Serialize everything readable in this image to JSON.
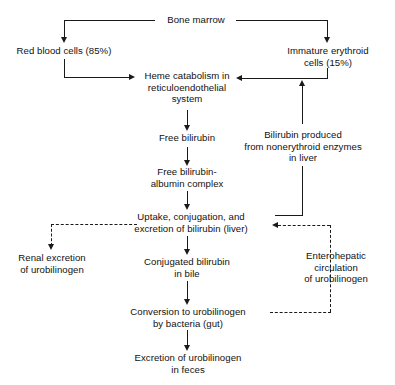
{
  "diagram": {
    "colors": {
      "background": "#ffffff",
      "ink": "#1a1a1a",
      "text": "#111111"
    },
    "nodes": {
      "bone_marrow": "Bone marrow",
      "red_blood_cells": "Red blood cells (85%)",
      "immature_erythroid": "Immature erythroid\ncells (15%)",
      "heme_catabolism": "Heme catabolism in\nreticuloendothelial\nsystem",
      "free_bilirubin": "Free bilirubin",
      "free_bilirubin_albumin": "Free bilirubin-\nalbumin complex",
      "bilirubin_nonerythroid": "Bilirubin produced\nfrom nonerythroid enzymes\nin liver",
      "uptake_conjugation": "Uptake, conjugation, and\nexcretion of bilirubin (liver)",
      "renal_excretion": "Renal excretion\nof urobilinogen",
      "conjugated_bilirubin": "Conjugated bilirubin\nin bile",
      "enterohepatic": "Enterohepatic\ncirculation\nof urobilinogen",
      "conversion_urobilinogen": "Conversion to urobilinogen\nby bacteria (gut)",
      "excretion_feces": "Excretion of urobilinogen\nin feces"
    },
    "edges": [
      {
        "id": "bone-marrow-to-rbc",
        "from": "bone_marrow",
        "to": "red_blood_cells",
        "style": "solid"
      },
      {
        "id": "bone-marrow-to-immature",
        "from": "bone_marrow",
        "to": "immature_erythroid",
        "style": "solid"
      },
      {
        "id": "rbc-to-heme",
        "from": "red_blood_cells",
        "to": "heme_catabolism",
        "style": "solid"
      },
      {
        "id": "immature-to-heme",
        "from": "immature_erythroid",
        "to": "heme_catabolism",
        "style": "solid"
      },
      {
        "id": "nonerythroid-to-heme",
        "from": "bilirubin_nonerythroid",
        "to": "heme_catabolism",
        "style": "solid"
      },
      {
        "id": "heme-to-free-bilirubin",
        "from": "heme_catabolism",
        "to": "free_bilirubin",
        "style": "solid"
      },
      {
        "id": "free-bilirubin-to-albumin",
        "from": "free_bilirubin",
        "to": "free_bilirubin_albumin",
        "style": "solid"
      },
      {
        "id": "albumin-to-uptake",
        "from": "free_bilirubin_albumin",
        "to": "uptake_conjugation",
        "style": "solid"
      },
      {
        "id": "nonerythroid-to-uptake",
        "from": "bilirubin_nonerythroid",
        "to": "uptake_conjugation",
        "style": "solid"
      },
      {
        "id": "uptake-to-renal",
        "from": "uptake_conjugation",
        "to": "renal_excretion",
        "style": "dashed"
      },
      {
        "id": "uptake-to-conjugated",
        "from": "uptake_conjugation",
        "to": "conjugated_bilirubin",
        "style": "solid"
      },
      {
        "id": "conjugated-to-conversion",
        "from": "conjugated_bilirubin",
        "to": "conversion_urobilinogen",
        "style": "solid"
      },
      {
        "id": "conversion-to-excretion",
        "from": "conversion_urobilinogen",
        "to": "excretion_feces",
        "style": "solid"
      },
      {
        "id": "conversion-to-uptake-enterohepatic",
        "from": "conversion_urobilinogen",
        "to": "uptake_conjugation",
        "style": "dashed"
      }
    ]
  }
}
